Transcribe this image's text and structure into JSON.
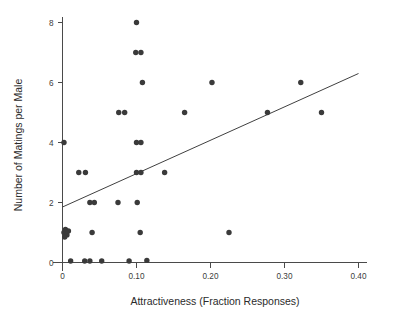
{
  "chart_data": {
    "type": "scatter",
    "title": "",
    "xlabel": "Attractiveness (Fraction Responses)",
    "ylabel": "Number of Matings per Male",
    "xlim": [
      0,
      0.4
    ],
    "ylim": [
      0,
      8.4
    ],
    "grid": false,
    "legend": null,
    "xticks": [
      0,
      0.1,
      0.2,
      0.3,
      0.4
    ],
    "xticklabels": [
      "0",
      "0.10",
      "0.20",
      "0.30",
      "0.40"
    ],
    "yticks": [
      0,
      2,
      4,
      6,
      8
    ],
    "yticklabels": [
      "0",
      "2",
      "4",
      "6",
      "8"
    ],
    "marker": "filled-circle",
    "marker_color": "#3a3a3a",
    "points": [
      {
        "x": 0.002,
        "y": 4
      },
      {
        "x": 0.022,
        "y": 3
      },
      {
        "x": 0.031,
        "y": 3
      },
      {
        "x": 0.1,
        "y": 3
      },
      {
        "x": 0.106,
        "y": 3
      },
      {
        "x": 0.138,
        "y": 3
      },
      {
        "x": 0.037,
        "y": 2
      },
      {
        "x": 0.043,
        "y": 2
      },
      {
        "x": 0.075,
        "y": 2
      },
      {
        "x": 0.101,
        "y": 2
      },
      {
        "x": 0.002,
        "y": 1
      },
      {
        "x": 0.004,
        "y": 1.1
      },
      {
        "x": 0.006,
        "y": 0.92
      },
      {
        "x": 0.008,
        "y": 1.05
      },
      {
        "x": 0.003,
        "y": 0.85
      },
      {
        "x": 0.04,
        "y": 1
      },
      {
        "x": 0.105,
        "y": 1
      },
      {
        "x": 0.225,
        "y": 1
      },
      {
        "x": 0.011,
        "y": 0.05
      },
      {
        "x": 0.03,
        "y": 0.05
      },
      {
        "x": 0.037,
        "y": 0.05
      },
      {
        "x": 0.053,
        "y": 0.05
      },
      {
        "x": 0.09,
        "y": 0.05
      },
      {
        "x": 0.114,
        "y": 0.07
      },
      {
        "x": 0.1,
        "y": 8
      },
      {
        "x": 0.099,
        "y": 7
      },
      {
        "x": 0.106,
        "y": 7
      },
      {
        "x": 0.108,
        "y": 6
      },
      {
        "x": 0.202,
        "y": 6
      },
      {
        "x": 0.322,
        "y": 6
      },
      {
        "x": 0.076,
        "y": 5
      },
      {
        "x": 0.084,
        "y": 5
      },
      {
        "x": 0.165,
        "y": 5
      },
      {
        "x": 0.277,
        "y": 5
      },
      {
        "x": 0.35,
        "y": 5
      },
      {
        "x": 0.1,
        "y": 4
      },
      {
        "x": 0.106,
        "y": 4
      }
    ],
    "fit_line": {
      "x_start": 0.0,
      "y_start": 1.85,
      "x_end": 0.4,
      "y_end": 6.3,
      "color": "#404040"
    }
  }
}
